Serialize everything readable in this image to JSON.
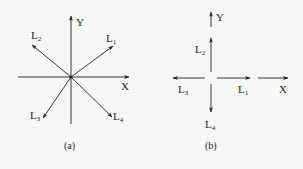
{
  "figure_a": {
    "caption": "(a)",
    "axes": {
      "x": "X",
      "y": "Y"
    },
    "vectors": [
      {
        "name": "L",
        "sub": "1",
        "direction": "upper-right"
      },
      {
        "name": "L",
        "sub": "2",
        "direction": "upper-left"
      },
      {
        "name": "L",
        "sub": "3",
        "direction": "lower-left"
      },
      {
        "name": "L",
        "sub": "4",
        "direction": "lower-right"
      }
    ]
  },
  "figure_b": {
    "caption": "(b)",
    "axes": {
      "x": "X",
      "y": "Y"
    },
    "vectors": [
      {
        "name": "L",
        "sub": "1",
        "direction": "right"
      },
      {
        "name": "L",
        "sub": "2",
        "direction": "up"
      },
      {
        "name": "L",
        "sub": "3",
        "direction": "left"
      },
      {
        "name": "L",
        "sub": "4",
        "direction": "down"
      }
    ]
  },
  "colors": {
    "line": "#222222",
    "background": "#f7f7f5"
  }
}
